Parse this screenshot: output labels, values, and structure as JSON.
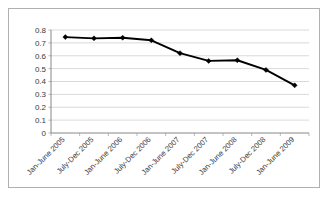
{
  "chart_data": {
    "type": "line",
    "title": "",
    "xlabel": "",
    "ylabel": "",
    "ylim": [
      0,
      0.8
    ],
    "ytick_values": [
      0.8,
      0.7,
      0.6,
      0.5,
      0.4,
      0.3,
      0.2,
      0.1,
      0
    ],
    "ytick_labels": [
      "0.8",
      "0.7",
      "0.6",
      "0.5",
      "0.4",
      "0.3",
      "0.2",
      "0.1",
      "0"
    ],
    "grid": "horizontal",
    "legend": "none",
    "marker": "diamond",
    "line_color": "#000000",
    "grid_color": "#c8c8c8",
    "axis_color": "#7a7a7a",
    "categories": [
      "Jan-June 2005",
      "July-Dec 2005",
      "Jan-June 2006",
      "July-Dec 2006",
      "Jan-June 2007",
      "July-Dec 2007",
      "Jan-June 2008",
      "July-Dec 2008",
      "Jan-June 2009"
    ],
    "values": [
      0.745,
      0.735,
      0.74,
      0.72,
      0.62,
      0.56,
      0.565,
      0.49,
      0.37
    ],
    "xlabel_rotation": -45
  }
}
